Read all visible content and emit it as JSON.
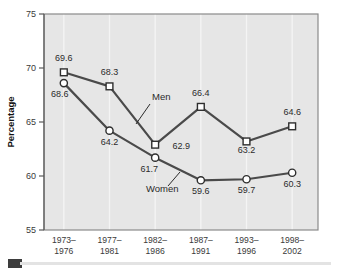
{
  "chart_data": {
    "type": "line",
    "title": "",
    "xlabel": "",
    "ylabel": "Percentage",
    "ylim": [
      55,
      75
    ],
    "yticks": [
      55,
      60,
      65,
      70,
      75
    ],
    "grid": "vertical",
    "legend_position": "inline-annotation",
    "categories": [
      "1973–1976",
      "1977–1981",
      "1982–1986",
      "1987–1991",
      "1993–1996",
      "1998–2002"
    ],
    "categories_lines": [
      [
        "1973–",
        "1976"
      ],
      [
        "1977–",
        "1981"
      ],
      [
        "1982–",
        "1986"
      ],
      [
        "1987–",
        "1991"
      ],
      [
        "1993–",
        "1996"
      ],
      [
        "1998–",
        "2002"
      ]
    ],
    "series": [
      {
        "name": "Men",
        "marker": "square",
        "values": [
          69.6,
          68.3,
          62.9,
          66.4,
          63.2,
          64.6
        ],
        "labels": [
          "69.6",
          "68.3",
          "62.9",
          "66.4",
          "63.2",
          "64.6"
        ]
      },
      {
        "name": "Women",
        "marker": "circle",
        "values": [
          68.6,
          64.2,
          61.7,
          59.6,
          59.7,
          60.3
        ],
        "labels": [
          "68.6",
          "64.2",
          "61.7",
          "59.6",
          "59.7",
          "60.3"
        ]
      }
    ],
    "annotations": [
      {
        "text": "Men",
        "series": "Men"
      },
      {
        "text": "Women",
        "series": "Women"
      }
    ],
    "colors": {
      "line": "#4a4a4a",
      "marker_fill": "#ffffff",
      "marker_stroke": "#2e2e2e",
      "plot_background": "#e6e6e6",
      "grid": "#f4f4f4",
      "axis": "#5a5a5a",
      "text": "#2b2b2b"
    }
  },
  "axis": {
    "y_tick_labels": [
      "75",
      "70",
      "65",
      "60",
      "55"
    ],
    "y_title": "Percentage"
  },
  "footer": {
    "marker_name": "source-marker"
  }
}
